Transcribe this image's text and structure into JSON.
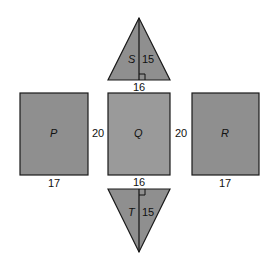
{
  "shapes": {
    "S": {
      "label": "S",
      "height": "15",
      "base": "16"
    },
    "P": {
      "label": "P",
      "width": "17",
      "height": "20"
    },
    "Q": {
      "label": "Q",
      "width_top": "16",
      "width_bottom": "16"
    },
    "R": {
      "label": "R",
      "width": "17",
      "height": "20"
    },
    "T": {
      "label": "T",
      "height": "15"
    }
  },
  "labels": {
    "pq_side": "20",
    "qr_side": "20"
  },
  "colors": {
    "fill": "#8f8f8f",
    "fill_q": "#9a9a9a",
    "stroke": "#1a1a1a"
  }
}
